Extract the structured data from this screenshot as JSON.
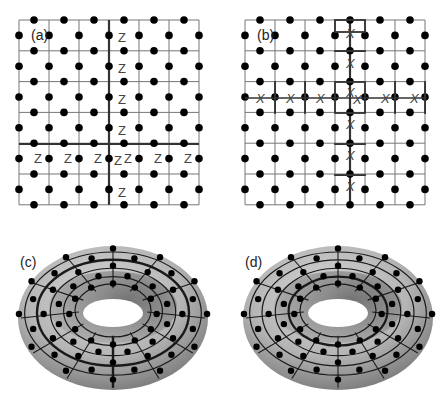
{
  "figure": {
    "panels": [
      {
        "id": "a",
        "label": "(a)",
        "type": "square-lattice",
        "operator_symbol": "Z",
        "label_pos": [
          31,
          35
        ]
      },
      {
        "id": "b",
        "label": "(b)",
        "type": "square-lattice",
        "operator_symbol": "X",
        "label_pos": [
          257,
          35
        ]
      },
      {
        "id": "c",
        "label": "(c)",
        "type": "torus",
        "label_pos": [
          20,
          262
        ]
      },
      {
        "id": "d",
        "label": "(d)",
        "type": "torus",
        "label_pos": [
          245,
          262
        ]
      }
    ],
    "lattice": {
      "cols": 6,
      "rows": 6,
      "cell_w": 30,
      "cell_h": 30.8,
      "line_color": "#777777",
      "thick_color": "#333333",
      "dot_color": "#000000",
      "dot_r": 3.8
    },
    "panel_a": {
      "origin": [
        19,
        20
      ],
      "thick_vertical_x": 109,
      "thick_horizontal_y": 144,
      "z_vertical": [
        [
          118,
          37
        ],
        [
          118,
          68
        ],
        [
          118,
          99
        ],
        [
          118,
          130
        ],
        [
          118,
          192
        ]
      ],
      "z_horizontal": [
        [
          34,
          158
        ],
        [
          64,
          158
        ],
        [
          94,
          158
        ],
        [
          124,
          158
        ],
        [
          154,
          158
        ],
        [
          184,
          158
        ],
        [
          114,
          160
        ]
      ]
    },
    "panel_b": {
      "origin": [
        245,
        20
      ],
      "thick_vertical_x": 350,
      "x_vertical": [
        [
          350,
          33
        ],
        [
          350,
          63
        ],
        [
          350,
          92
        ],
        [
          350,
          124
        ],
        [
          350,
          155
        ],
        [
          350,
          186
        ]
      ],
      "x_horizontal": [
        [
          260,
          98
        ],
        [
          290,
          98
        ],
        [
          320,
          98
        ],
        [
          357,
          99
        ],
        [
          385,
          98
        ],
        [
          414,
          98
        ]
      ],
      "plaquettes": [
        [
          335,
          20,
          30,
          12
        ],
        [
          335,
          51,
          30,
          0.1
        ],
        [
          335,
          82,
          30,
          31
        ],
        [
          275,
          82,
          0.1,
          31
        ],
        [
          305,
          82,
          0.1,
          31
        ],
        [
          395,
          82,
          0.1,
          31
        ],
        [
          425,
          82,
          0.1,
          31
        ],
        [
          335,
          144,
          30,
          0.1
        ],
        [
          335,
          175,
          30,
          0.1
        ]
      ]
    },
    "torus_c": {
      "cx": 113,
      "cy": 318,
      "rx": 95,
      "ry": 72,
      "hole_rx": 30,
      "hole_ry": 14,
      "hole_cy": 313
    },
    "torus_d": {
      "cx": 338,
      "cy": 318,
      "rx": 95,
      "ry": 72,
      "hole_rx": 30,
      "hole_ry": 14,
      "hole_cy": 313
    }
  }
}
